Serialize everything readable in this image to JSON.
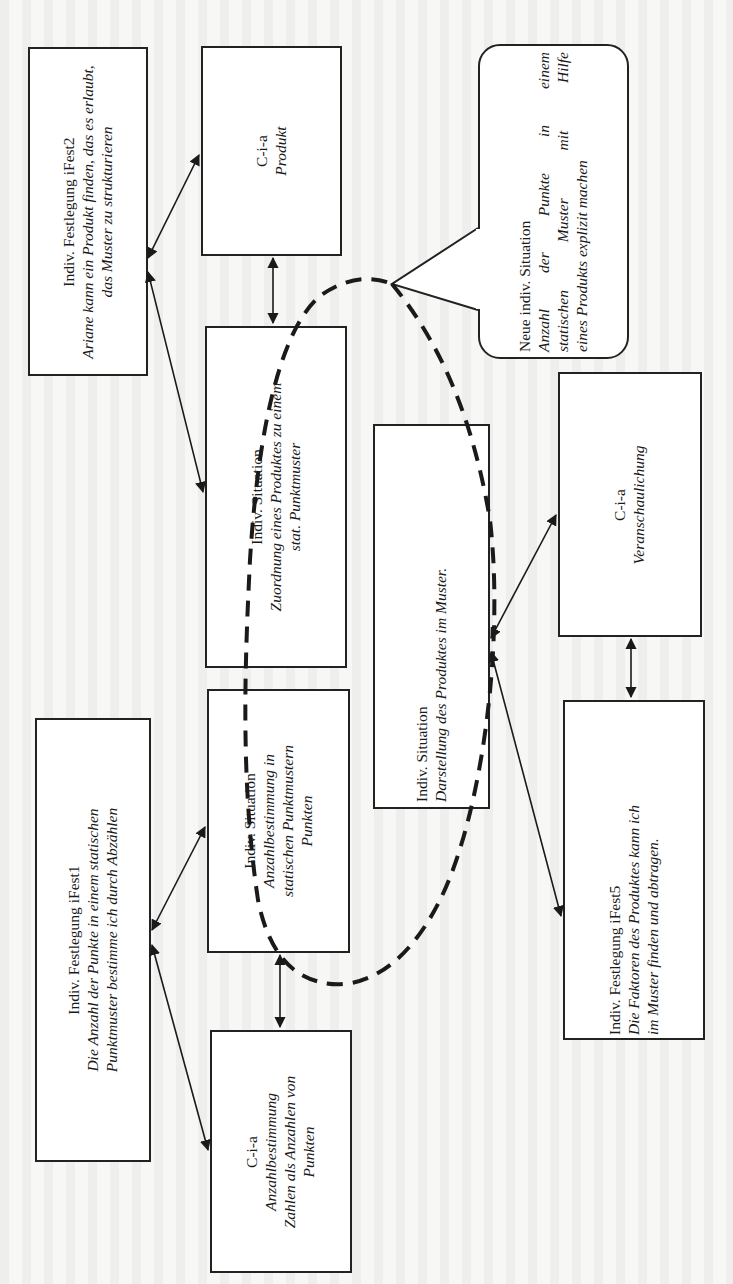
{
  "diagram": {
    "orientation": "rotated 90 degrees counter-clockwise",
    "nodes": [
      {
        "id": "ifest2",
        "title": "Indiv. Festlegung iFest2",
        "lines": [
          "Ariane kann ein Produkt finden, das es erlaubt,",
          "das Muster zu strukturieren"
        ]
      },
      {
        "id": "cia-produkt",
        "title": "C-i-a",
        "lines": [
          "Produkt"
        ]
      },
      {
        "id": "sit-zuordnung",
        "title": "Indiv. Situation",
        "lines": [
          "Zuordnung eines Produktes zu einem",
          "stat. Punktmuster"
        ]
      },
      {
        "id": "sit-anzahl",
        "title": "Indiv. Situation",
        "lines": [
          "Anzahlbestimmung in",
          "statischen Punktmustern",
          "Punkten"
        ]
      },
      {
        "id": "ifest1",
        "title": "Indiv. Festlegung iFest1",
        "lines": [
          "Die Anzahl der Punkte in einem statischen",
          "Punktmuster bestimme ich durch Abzählen"
        ]
      },
      {
        "id": "cia-anzahl",
        "title": "C-i-a",
        "lines": [
          "Anzahlbestimmung",
          "Zahlen als Anzahlen von",
          "Punkten"
        ]
      },
      {
        "id": "neue-sit",
        "title": "Neue indiv. Situation",
        "lines": [
          "Anzahl der Punkte in einem",
          "statischen Muster mit Hilfe",
          "eines Produkts explizit machen"
        ]
      },
      {
        "id": "sit-darstellung",
        "title": "Indiv. Situation",
        "lines": [
          "Darstellung des Produktes im Muster."
        ]
      },
      {
        "id": "cia-veranschaulichung",
        "title": "C-i-a",
        "lines": [
          "Veranschaulichung"
        ]
      },
      {
        "id": "ifest5",
        "title": "Indiv. Festlegung iFest5",
        "lines": [
          "Die Faktoren des Produktes kann ich",
          "im Muster finden und abtragen."
        ]
      }
    ],
    "edges": [
      [
        "ifest2",
        "cia-produkt"
      ],
      [
        "ifest2",
        "sit-zuordnung"
      ],
      [
        "cia-produkt",
        "sit-zuordnung"
      ],
      [
        "ifest1",
        "sit-anzahl"
      ],
      [
        "ifest1",
        "cia-anzahl"
      ],
      [
        "sit-anzahl",
        "cia-anzahl"
      ],
      [
        "sit-darstellung",
        "cia-veranschaulichung"
      ],
      [
        "sit-darstellung",
        "ifest5"
      ],
      [
        "cia-veranschaulichung",
        "ifest5"
      ]
    ],
    "dashed_ellipse": "encloses the transition from the static-pattern situations to the new situation",
    "colors": {
      "stroke": "#222222",
      "box_fill": "#ffffff",
      "page": "#f7f7f5"
    }
  }
}
